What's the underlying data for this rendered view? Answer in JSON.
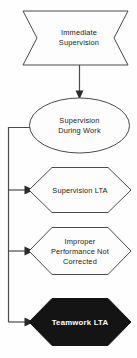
{
  "diagram": {
    "background_color": "#fefefe",
    "line_color": "#4a4a4a",
    "text_color": "#232323",
    "filled_node_color": "#141414",
    "filled_node_text_color": "#ffffff",
    "nodes": [
      {
        "id": "immediate-supervision",
        "shape": "banner",
        "lines": [
          "Immediate",
          "Supervision"
        ],
        "filled": false
      },
      {
        "id": "supervision-during-work",
        "shape": "ellipse",
        "lines": [
          "Supervision",
          "During Work"
        ],
        "filled": false
      },
      {
        "id": "supervision-lta",
        "shape": "hexagon",
        "lines": [
          "Supervision LTA"
        ],
        "filled": false
      },
      {
        "id": "improper-performance-not-corrected",
        "shape": "hexagon",
        "lines": [
          "Improper",
          "Performance Not",
          "Corrected"
        ],
        "filled": false
      },
      {
        "id": "teamwork-lta",
        "shape": "hexagon",
        "lines": [
          "Teamwork LTA"
        ],
        "filled": true
      }
    ],
    "connectors": [
      {
        "id": "banner-to-ellipse",
        "from": "immediate-supervision",
        "to": "supervision-during-work",
        "style": "vertical-arrow"
      },
      {
        "id": "ellipse-to-supervision-lta",
        "from": "supervision-during-work",
        "to": "supervision-lta",
        "style": "elbow-arrow"
      },
      {
        "id": "ellipse-to-improper-performance",
        "from": "supervision-during-work",
        "to": "improper-performance-not-corrected",
        "style": "elbow-arrow"
      },
      {
        "id": "ellipse-to-teamwork-lta",
        "from": "supervision-during-work",
        "to": "teamwork-lta",
        "style": "elbow-arrow"
      }
    ]
  }
}
